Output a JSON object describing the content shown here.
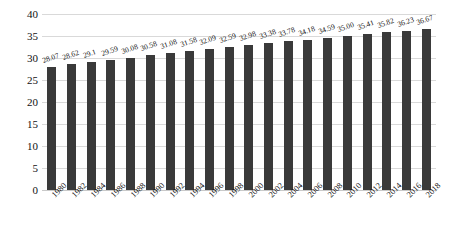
{
  "chart_data": {
    "type": "bar",
    "title": "",
    "subtitle": "",
    "xlabel": "",
    "ylabel": "",
    "ylim": [
      0,
      40
    ],
    "ytick_values": [
      40,
      35,
      30,
      25,
      20,
      15,
      10,
      5,
      0
    ],
    "ytick_labels": [
      "40",
      "35",
      "30",
      "25",
      "20",
      "15",
      "10",
      "5",
      "0"
    ],
    "grid": true,
    "legend": false,
    "legend_position": "none",
    "bar_color": "#3a3a3a",
    "gridline_color": "#d9d9d9",
    "data_labels_shown": true,
    "categories": [
      "1980",
      "1982",
      "1984",
      "1986",
      "1988",
      "1990",
      "1992",
      "1994",
      "1996",
      "1998",
      "2000",
      "2002",
      "2004",
      "2006",
      "2008",
      "2010",
      "2012",
      "2014",
      "2016",
      "2018"
    ],
    "values": [
      28.07,
      28.62,
      29.1,
      29.59,
      30.08,
      30.58,
      31.08,
      31.58,
      32.09,
      32.59,
      32.98,
      33.38,
      33.78,
      34.18,
      34.59,
      35.0,
      35.41,
      35.82,
      36.23,
      36.67
    ],
    "value_labels": [
      "28.07",
      "28.62",
      "29.1",
      "29.59",
      "30.08",
      "30.58",
      "31.08",
      "31.58",
      "32.09",
      "32.59",
      "32.98",
      "33.38",
      "33.78",
      "34.18",
      "34.59",
      "35.00",
      "35.41",
      "35.82",
      "36.23",
      "36.67"
    ]
  }
}
